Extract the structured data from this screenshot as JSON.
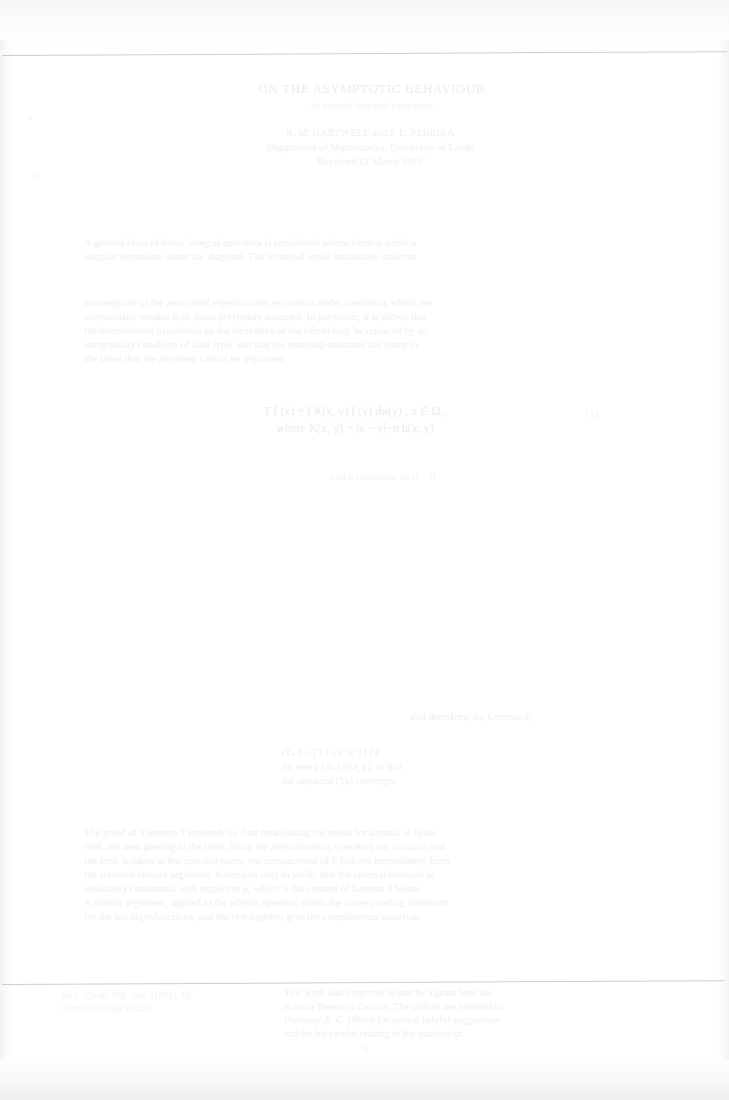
{
  "document": {
    "kind": "faded-scanned-page",
    "page_number": "4",
    "ink_color": "#f4f5f7",
    "rule_color": "#c9cdd3",
    "paper_color": "#ffffff"
  },
  "title": {
    "main": "ON THE ASYMPTOTIC BEHAVIOUR",
    "sub": "of certain integral operators"
  },
  "authors": [
    "R. M. HARTWELL  and  J. L. PEREIRA",
    "Department of Mathematics, University of Leeds",
    "Received 12 March 1971"
  ],
  "paragraph_1": [
    "A general class of linear integral operators is considered whose kernels admit a",
    "singular expansion about the diagonal. The principal result establishes uniform"
  ],
  "paragraph_2": [
    "convergence of the associated eigenfunction expansion under conditions which are",
    "substantially weaker than those previously assumed. In particular, it is shown that",
    "the boundedness hypothesis on the derivative of the kernel may be replaced by an",
    "integrability condition of Dini type, and that the resulting estimates are sharp in",
    "the sense that the exponent cannot be improved."
  ],
  "equation": {
    "body": "T f (x)  =  ∫  K(x, y) f (y) dμ(y) ,    x ∈ Ω ,",
    "condition": "where  K(x, y) = |x − y|−α h(x, y)",
    "number": "(1)"
  },
  "caption": "with h continuous on Ω × Ω .",
  "section_head": "and therefore, by Lemma 2,",
  "sub_lines": [
    "‖Tₙ f − T f ‖ ≤ C n⁻¹ ‖ f ‖",
    "for every f in L²(Ω, μ), so that",
    "the sequence (Tₙ) converges."
  ],
  "paragraph_3": [
    "The proof of Theorem 1 proceeds by first establishing the result for kernels of finite",
    "rank and then passing to the limit. Since the approximating operators are compact and",
    "the limit is taken in the operator norm, the compactness of T follows immediately from",
    "the standard closure argument. It remains only to verify that the spectral measure is",
    "absolutely continuous with respect to μ, which is the content of Lemma 3 below.",
    "A similar argument, applied to the adjoint operator, yields the corresponding statement",
    "for the left eigenfunctions, and the two together give the completeness assertion."
  ],
  "footer": {
    "left": [
      "Proc. Camb. Phil. Soc. (1971), 70",
      "Printed in Great Britain"
    ],
    "main": [
      "This work was supported in part by a grant from the",
      "Science Research Council. The authors are indebted to",
      "Professor A. C. Offord for several helpful suggestions",
      "and for his careful reading of the manuscript."
    ],
    "page_label": "4"
  }
}
